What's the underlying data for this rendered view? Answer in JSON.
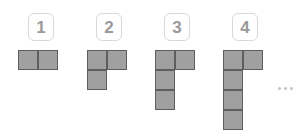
{
  "diagram": {
    "type": "figurate-sequence",
    "colors": {
      "cell_fill": "#a0a0a0",
      "cell_border": "#5e5e5e",
      "label_border": "#d9d9d9",
      "label_text": "#9a9a9a",
      "ellipsis_dot": "#c2c2c2",
      "background": "#ffffff"
    },
    "cell_size_px": 20,
    "figures": [
      {
        "label": "1",
        "label_x": 28,
        "label_y": 13,
        "grid_x": 18,
        "grid_y": 50,
        "square_count": 2,
        "rows": 1,
        "cols": 2,
        "cells": [
          [
            0,
            0
          ],
          [
            1,
            0
          ]
        ]
      },
      {
        "label": "2",
        "label_x": 96,
        "label_y": 13,
        "grid_x": 87,
        "grid_y": 50,
        "square_count": 3,
        "rows": 2,
        "cols": 2,
        "cells": [
          [
            0,
            0
          ],
          [
            1,
            0
          ],
          [
            0,
            1
          ]
        ]
      },
      {
        "label": "3",
        "label_x": 164,
        "label_y": 13,
        "grid_x": 155,
        "grid_y": 50,
        "square_count": 4,
        "rows": 3,
        "cols": 2,
        "cells": [
          [
            0,
            0
          ],
          [
            1,
            0
          ],
          [
            0,
            1
          ],
          [
            0,
            2
          ]
        ]
      },
      {
        "label": "4",
        "label_x": 232,
        "label_y": 13,
        "grid_x": 223,
        "grid_y": 50,
        "square_count": 5,
        "rows": 4,
        "cols": 2,
        "cells": [
          [
            0,
            0
          ],
          [
            1,
            0
          ],
          [
            0,
            1
          ],
          [
            0,
            2
          ],
          [
            0,
            3
          ]
        ]
      }
    ],
    "continuation": {
      "symbol": "...",
      "x": 278,
      "y": 87,
      "dot_count": 3
    }
  }
}
